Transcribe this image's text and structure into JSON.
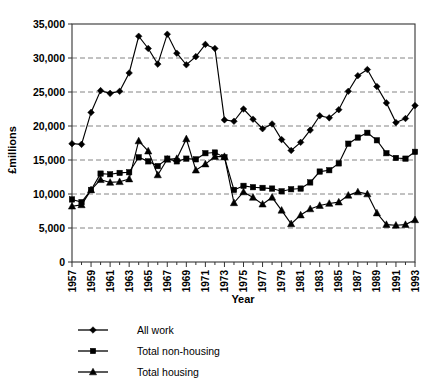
{
  "chart_data": {
    "type": "line",
    "title": "",
    "xlabel": "Year",
    "ylabel": "£millions",
    "xlim": [
      1957,
      1993
    ],
    "ylim": [
      0,
      35000
    ],
    "ytick_step": 5000,
    "yticks": [
      "0",
      "5,000",
      "10,000",
      "15,000",
      "20,000",
      "25,000",
      "30,000",
      "35,000"
    ],
    "ytick_values": [
      0,
      5000,
      10000,
      15000,
      20000,
      25000,
      30000,
      35000
    ],
    "xticks": [
      "1957",
      "1959",
      "1961",
      "1963",
      "1965",
      "1967",
      "1969",
      "1971",
      "1973",
      "1975",
      "1977",
      "1979",
      "1981",
      "1983",
      "1985",
      "1987",
      "1989",
      "1991",
      "1993"
    ],
    "xtick_values": [
      1957,
      1959,
      1961,
      1963,
      1965,
      1967,
      1969,
      1971,
      1973,
      1975,
      1977,
      1979,
      1981,
      1983,
      1985,
      1987,
      1989,
      1991,
      1993
    ],
    "xtick_rotation": "vertical",
    "grid": "horizontal-dashed",
    "legend_position": "bottom-left",
    "x": [
      1957,
      1958,
      1959,
      1960,
      1961,
      1962,
      1963,
      1964,
      1965,
      1966,
      1967,
      1968,
      1969,
      1970,
      1971,
      1972,
      1973,
      1974,
      1975,
      1976,
      1977,
      1978,
      1979,
      1980,
      1981,
      1982,
      1983,
      1984,
      1985,
      1986,
      1987,
      1988,
      1989,
      1990,
      1991,
      1992,
      1993
    ],
    "series": [
      {
        "name": "All work",
        "marker": "diamond",
        "values": [
          17400,
          17300,
          22000,
          25200,
          24800,
          25100,
          27800,
          33200,
          31400,
          29100,
          33500,
          30700,
          29000,
          30200,
          32000,
          31400,
          20900,
          20700,
          22500,
          21000,
          19600,
          20300,
          18000,
          16400,
          17600,
          19400,
          21500,
          21200,
          22400,
          25100,
          27400,
          28300,
          25800,
          23400,
          20500,
          21100,
          23000
        ]
      },
      {
        "name": "Total non-housing",
        "marker": "square",
        "values": [
          9200,
          8800,
          10600,
          13000,
          12900,
          13100,
          13200,
          15400,
          14800,
          14100,
          15200,
          14800,
          15200,
          15100,
          16000,
          16100,
          15400,
          10600,
          11200,
          11000,
          10900,
          10800,
          10400,
          10700,
          10800,
          11700,
          13300,
          13500,
          14500,
          17400,
          18300,
          19000,
          17900,
          16000,
          15300,
          15200,
          16200
        ]
      },
      {
        "name": "Total housing",
        "marker": "triangle",
        "values": [
          8200,
          8400,
          10600,
          12100,
          11700,
          11800,
          12200,
          17800,
          16300,
          12800,
          15100,
          15200,
          18100,
          13500,
          14400,
          15500,
          15500,
          8700,
          10300,
          9500,
          8500,
          9500,
          7600,
          5600,
          6900,
          7800,
          8300,
          8600,
          8800,
          9800,
          10300,
          10000,
          7200,
          5500,
          5400,
          5500,
          6200
        ]
      }
    ]
  },
  "legend": {
    "items": [
      {
        "label": "All work",
        "marker": "diamond"
      },
      {
        "label": "Total non-housing",
        "marker": "square"
      },
      {
        "label": "Total housing",
        "marker": "triangle"
      }
    ]
  },
  "axis": {
    "x_title": "Year",
    "y_title": "£millions"
  }
}
